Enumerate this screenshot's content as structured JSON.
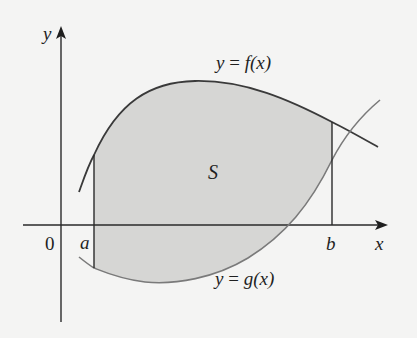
{
  "diagram": {
    "colors": {
      "background": "#f4f4f3",
      "region_fill": "#d6d6d4",
      "axis": "#2a2a2a",
      "curve_f": "#3a3a3a",
      "curve_g": "#7a7a7a",
      "bounds": "#2a2a2a",
      "text": "#1f1f1f"
    },
    "labels": {
      "y_axis": "y",
      "x_axis": "x",
      "origin": "0",
      "a": "a",
      "b": "b",
      "region": "S",
      "f_curve": {
        "lhs": "y",
        "eq": " = ",
        "fn": "f",
        "arg": "(x)"
      },
      "g_curve": {
        "lhs": "y",
        "eq": " = ",
        "fn": "g",
        "arg": "(x)"
      }
    },
    "elements": {
      "curves": [
        {
          "name": "f",
          "label": "y = f(x)",
          "role": "upper boundary"
        },
        {
          "name": "g",
          "label": "y = g(x)",
          "role": "lower boundary"
        }
      ],
      "vertical_bounds": [
        "x = a",
        "x = b"
      ],
      "shaded_region": "S"
    }
  }
}
